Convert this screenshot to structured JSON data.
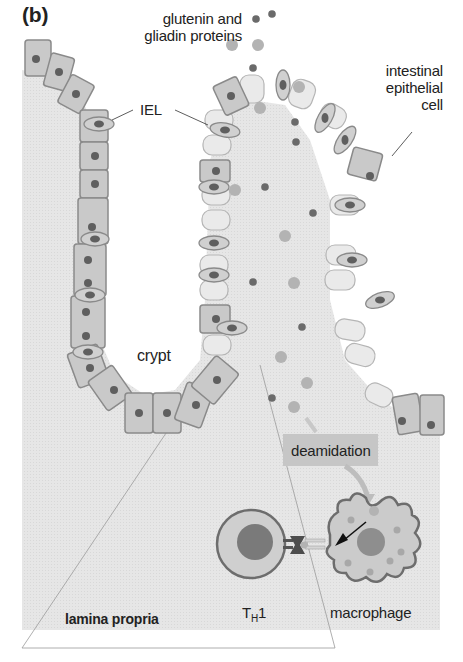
{
  "figure": {
    "panel_label": "(b)",
    "colors": {
      "tissue_bg": "#e4e4e4",
      "cell_fill": "#c9c9c9",
      "cell_stroke": "#8a8a8a",
      "light_cell_fill": "#e9e9e9",
      "nucleus": "#5f5f5f",
      "dark_dot": "#6a6a6a",
      "light_dot": "#b3b3b3",
      "deamidation_box": "#c6c6c6",
      "arrow_light": "#bdbdbd"
    },
    "labels": {
      "proteins_line1": "glutenin and",
      "proteins_line2": "gliadin proteins",
      "iel": "IEL",
      "epithelial_line1": "intestinal",
      "epithelial_line2": "epithelial",
      "epithelial_line3": "cell",
      "crypt": "crypt",
      "deamidation": "deamidation",
      "th1_main": "T",
      "th1_sub": "H",
      "th1_suffix": "1",
      "macrophage": "macrophage",
      "lamina_propria": "lamina propria"
    },
    "legend": [
      {
        "label": "glutenin",
        "marker": "dark-dot"
      },
      {
        "label": "gliadin",
        "marker": "light-dot"
      }
    ]
  }
}
